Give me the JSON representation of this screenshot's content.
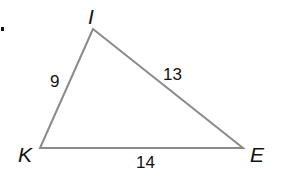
{
  "diagram": {
    "type": "triangle",
    "line_color": "#8a8a8a",
    "text_color": "#111111",
    "bullet": {
      "x": 1,
      "y": 27,
      "w": 3,
      "h": 4
    },
    "vertices": [
      {
        "id": "I",
        "label": "I",
        "x": 93,
        "y": 29,
        "label_x": 88,
        "label_y": 24
      },
      {
        "id": "K",
        "label": "K",
        "x": 40,
        "y": 148,
        "label_x": 18,
        "label_y": 162
      },
      {
        "id": "E",
        "label": "E",
        "x": 243,
        "y": 148,
        "label_x": 250,
        "label_y": 162
      }
    ],
    "sides": [
      {
        "id": "IK",
        "from": "I",
        "to": "K",
        "label": "9",
        "label_x": 50,
        "label_y": 87
      },
      {
        "id": "IE",
        "from": "I",
        "to": "E",
        "label": "13",
        "label_x": 163,
        "label_y": 80
      },
      {
        "id": "KE",
        "from": "K",
        "to": "E",
        "label": "14",
        "label_x": 136,
        "label_y": 168
      }
    ]
  }
}
